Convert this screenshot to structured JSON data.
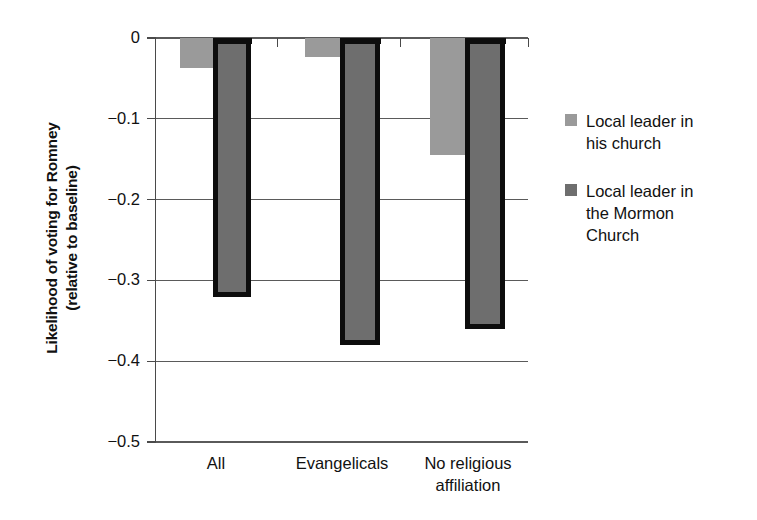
{
  "chart_data": {
    "type": "bar",
    "title": "",
    "xlabel": "",
    "ylabel": "Likelihood of voting for Romney\n(relative to baseline)",
    "categories": [
      "All",
      "Evangelicals",
      "No religious\naffiliation"
    ],
    "series": [
      {
        "name": "Local leader in\nhis church",
        "color": "#9a9a9a",
        "values": [
          -0.037,
          -0.023,
          -0.145
        ]
      },
      {
        "name": "Local leader in\nthe Mormon\nChurch",
        "color": "#6e6e6e",
        "values": [
          -0.32,
          -0.38,
          -0.36
        ]
      }
    ],
    "ylim": [
      -0.5,
      0
    ],
    "yticks": [
      "0",
      "−0.1",
      "−0.2",
      "−0.3",
      "−0.4",
      "−0.5"
    ],
    "ytick_values": [
      0,
      -0.1,
      -0.2,
      -0.3,
      -0.4,
      -0.5
    ],
    "grid": true,
    "legend_position": "right"
  },
  "axis": {
    "y_title": "Likelihood of voting for Romney\n(relative to baseline)"
  },
  "legend": {
    "items": [
      {
        "label": "Local leader in\nhis church",
        "color": "#9a9a9a"
      },
      {
        "label": "Local leader in\nthe Mormon\nChurch",
        "color": "#6e6e6e"
      }
    ]
  }
}
